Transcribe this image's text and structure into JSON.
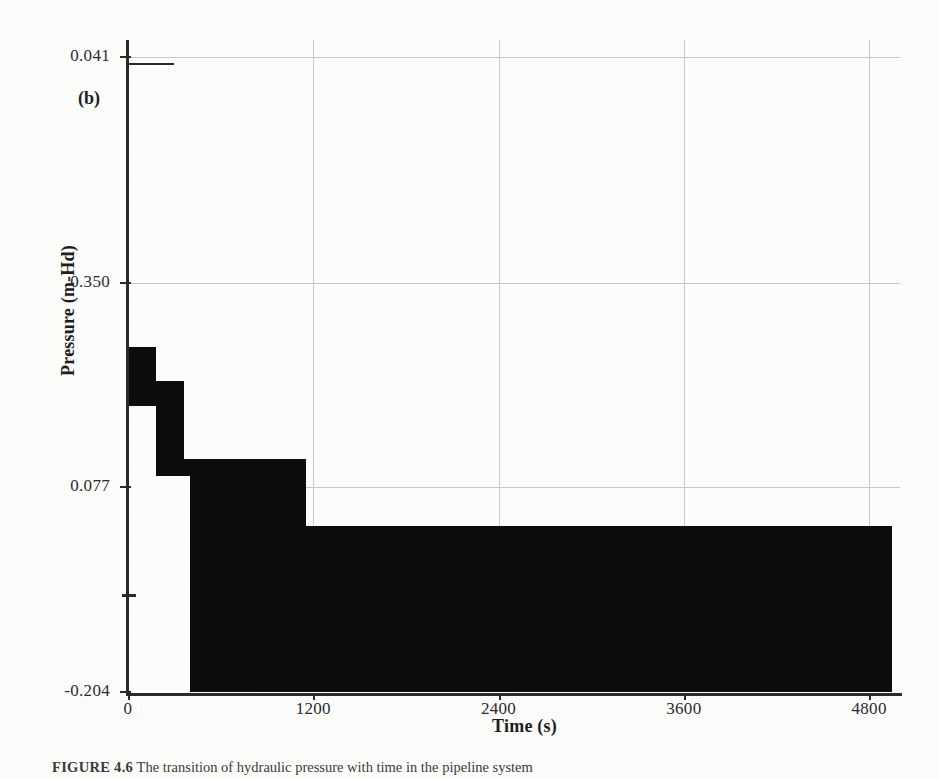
{
  "figure": {
    "panel_label": "(b)",
    "caption_prefix": "FIGURE 4.6",
    "caption_text": "The transition of hydraulic pressure with time in the pipeline system"
  },
  "chart_data": {
    "type": "area",
    "title": "",
    "subtitle": "",
    "xlabel": "Time (s)",
    "ylabel": "Pressure (m-Hd)",
    "xlim": [
      0,
      5000
    ],
    "ylim": [
      -0.204,
      0.041
    ],
    "grid": true,
    "legend": null,
    "x_ticks": [
      0,
      1200,
      2400,
      3600,
      4800
    ],
    "x_tick_labels": [
      "0",
      "1200",
      "2400",
      "3600",
      "4800"
    ],
    "y_ticks": [
      0.041,
      0.35,
      0.077,
      -0.204
    ],
    "y_tick_labels": [
      "0.041",
      "0.350",
      "0.077",
      "-0.204"
    ],
    "series_name": "Pressure",
    "fill_color": "#0d0d0d",
    "grid_color": "#c9c9c9",
    "axis_color": "#2b2b2b",
    "steps": [
      {
        "x_start": 0,
        "x_end": 180,
        "level": 0.543,
        "label": "step-1"
      },
      {
        "x_start": 180,
        "x_end": 360,
        "level": 0.489,
        "label": "step-2"
      },
      {
        "x_start": 360,
        "x_end": 1150,
        "level": 0.367,
        "label": "step-3"
      },
      {
        "x_start": 1150,
        "x_end": 4950,
        "level": 0.261,
        "label": "step-4"
      }
    ],
    "lower_notch": [
      {
        "x_start": 0,
        "x_end": 180,
        "level": -0.05,
        "label": "notch-upper"
      },
      {
        "x_start": 180,
        "x_end": 400,
        "level": -0.16,
        "label": "notch-lower"
      }
    ],
    "annotations": [
      "(b)"
    ]
  },
  "axis": {
    "y_title": "Pressure (m-Hd)",
    "x_title": "Time (s)"
  }
}
